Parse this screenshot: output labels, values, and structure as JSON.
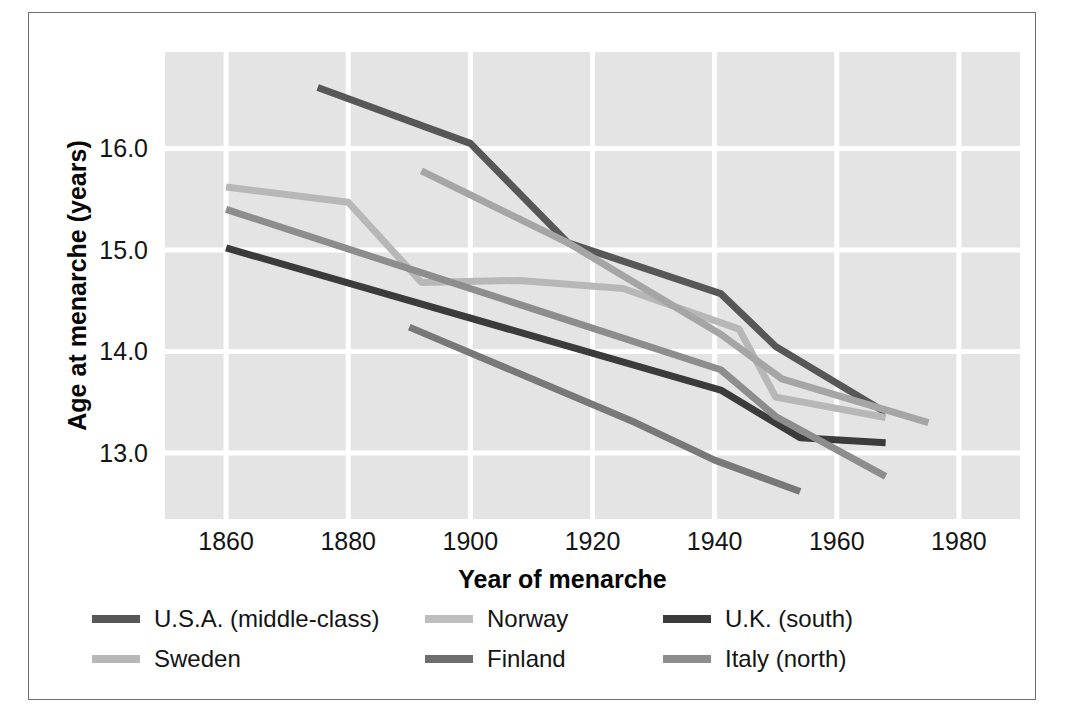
{
  "figure": {
    "background_color": "#ffffff",
    "frame_color": "#6d6f74",
    "plot_background_color": "#e4e4e4",
    "gridline_color": "#ffffff"
  },
  "chart_data": {
    "type": "line",
    "title": "",
    "xlabel": "Year of menarche",
    "ylabel": "Age at menarche (years)",
    "xlim": [
      1850,
      1990
    ],
    "ylim": [
      12.35,
      16.95
    ],
    "xticks": [
      1860,
      1880,
      1900,
      1920,
      1940,
      1960,
      1980
    ],
    "xtick_labels": [
      "1860",
      "1880",
      "1900",
      "1920",
      "1940",
      "1960",
      "1980"
    ],
    "yticks": [
      13.0,
      14.0,
      15.0,
      16.0
    ],
    "ytick_labels": [
      "13.0",
      "14.0",
      "15.0",
      "16.0"
    ],
    "grid": true,
    "legend_position": "below-axes",
    "series": [
      {
        "name": "U.S.A. (middle-class)",
        "color": "#575757",
        "points": [
          [
            1875,
            16.6
          ],
          [
            1900,
            16.05
          ],
          [
            1916,
            15.07
          ],
          [
            1941,
            14.57
          ],
          [
            1950,
            14.05
          ],
          [
            1968,
            13.4
          ]
        ]
      },
      {
        "name": "Sweden",
        "color": "#b7b7b7",
        "points": [
          [
            1860,
            15.62
          ],
          [
            1880,
            15.47
          ],
          [
            1892,
            14.68
          ],
          [
            1908,
            14.7
          ],
          [
            1925,
            14.62
          ],
          [
            1944,
            14.22
          ],
          [
            1950,
            13.55
          ],
          [
            1968,
            13.35
          ]
        ]
      },
      {
        "name": "Norway",
        "color": "#a5a5a5",
        "points": [
          [
            1892,
            15.78
          ],
          [
            1916,
            15.07
          ],
          [
            1941,
            14.17
          ],
          [
            1951,
            13.73
          ],
          [
            1975,
            13.3
          ]
        ]
      },
      {
        "name": "Finland",
        "color": "#787878",
        "points": [
          [
            1890,
            14.24
          ],
          [
            1927,
            13.3
          ],
          [
            1940,
            12.93
          ],
          [
            1954,
            12.62
          ]
        ]
      },
      {
        "name": "U.K. (south)",
        "color": "#3b3b3b",
        "points": [
          [
            1860,
            15.02
          ],
          [
            1941,
            13.62
          ],
          [
            1954,
            13.15
          ],
          [
            1968,
            13.1
          ]
        ]
      },
      {
        "name": "Italy (north)",
        "color": "#8d8d8d",
        "points": [
          [
            1860,
            15.4
          ],
          [
            1941,
            13.82
          ],
          [
            1950,
            13.36
          ],
          [
            1968,
            12.77
          ]
        ]
      }
    ]
  },
  "legend": {
    "entries": [
      {
        "label": "U.S.A. (middle-class)",
        "color": "#575757"
      },
      {
        "label": "Norway",
        "color": "#bdbdbd"
      },
      {
        "label": "U.K. (south)",
        "color": "#3b3b3b"
      },
      {
        "label": "Sweden",
        "color": "#b7b7b7"
      },
      {
        "label": "Finland",
        "color": "#6e6e6e"
      },
      {
        "label": "Italy (north)",
        "color": "#8d8d8d"
      }
    ]
  }
}
